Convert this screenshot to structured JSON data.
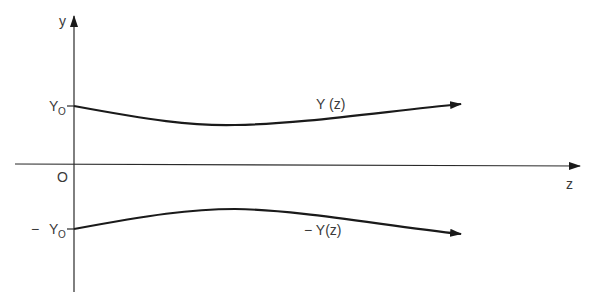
{
  "diagram": {
    "axes": {
      "vertical_label": "y",
      "horizontal_label": "z",
      "origin_label": "O"
    },
    "ticks": {
      "upper": {
        "label_main": "Y",
        "label_sub": "O"
      },
      "lower": {
        "label_prefix": "−",
        "label_main": "Y",
        "label_sub": "O"
      }
    },
    "curves": {
      "upper": {
        "label": "Y (z)"
      },
      "lower": {
        "label": "− Y(z)"
      }
    },
    "colors": {
      "line": "#1a1a1a",
      "text": "#3a3a3a",
      "background": "#ffffff"
    }
  }
}
